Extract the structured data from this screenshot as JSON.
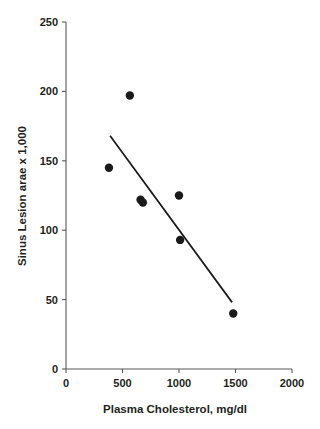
{
  "chart_data": {
    "type": "scatter",
    "title": "",
    "xlabel": "Plasma Cholesterol, mg/dl",
    "ylabel": "Sinus Lesion arae x 1,000",
    "xlim": [
      0,
      2000
    ],
    "ylim": [
      0,
      250
    ],
    "xticks": [
      0,
      500,
      1000,
      1500,
      2000
    ],
    "yticks": [
      0,
      50,
      100,
      150,
      200,
      250
    ],
    "xticklabels": [
      "0",
      "500",
      "1000",
      "1500",
      "2000"
    ],
    "yticklabels": [
      "0",
      "50",
      "100",
      "150",
      "200",
      "250"
    ],
    "grid": false,
    "legend": false,
    "marker": "filled-circle",
    "marker_color": "#1a1a1a",
    "points": [
      {
        "x": 380,
        "y": 145
      },
      {
        "x": 565,
        "y": 197
      },
      {
        "x": 660,
        "y": 122
      },
      {
        "x": 680,
        "y": 120
      },
      {
        "x": 1000,
        "y": 125
      },
      {
        "x": 1010,
        "y": 93
      },
      {
        "x": 1480,
        "y": 40
      }
    ],
    "trendline": {
      "type": "linear-fit",
      "color": "#1a1a1a",
      "x0": 390,
      "y0": 168,
      "x1": 1470,
      "y1": 48
    }
  },
  "colors": {
    "background": "#ffffff",
    "axis": "#58595b",
    "text": "#231f20",
    "data": "#1a1a1a"
  }
}
